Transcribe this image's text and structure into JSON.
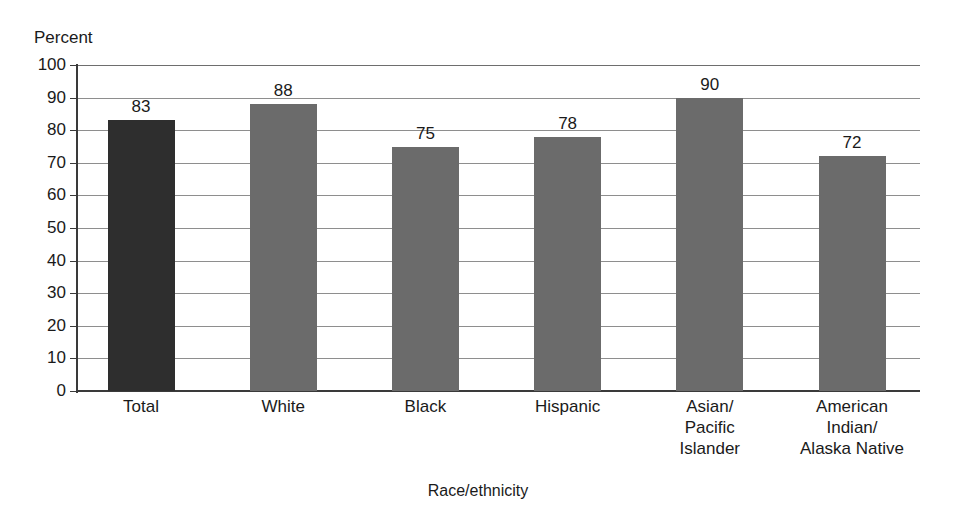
{
  "chart_data": {
    "type": "bar",
    "title": "",
    "subtitle": "",
    "xlabel": "Race/ethnicity",
    "ylabel": "Percent",
    "ylim": [
      0,
      100
    ],
    "yticks": [
      0,
      10,
      20,
      30,
      40,
      50,
      60,
      70,
      80,
      90,
      100
    ],
    "ytick_labels": [
      "0",
      "10",
      "20",
      "30",
      "40",
      "50",
      "60",
      "70",
      "80",
      "90",
      "100"
    ],
    "grid": true,
    "legend": "none",
    "data_labels": true,
    "categories": [
      "Total",
      "White",
      "Black",
      "Hispanic",
      "Asian/\nPacific\nIslander",
      "American\nIndian/\nAlaska Native"
    ],
    "values": [
      83,
      88,
      75,
      78,
      90,
      72
    ],
    "value_labels": [
      "83",
      "88",
      "75",
      "78",
      "90",
      "72"
    ],
    "bar_colors": [
      "#2e2e2e",
      "#6b6b6b",
      "#6b6b6b",
      "#6b6b6b",
      "#6b6b6b",
      "#6b6b6b"
    ],
    "colors": {
      "highlight_bar": "#2e2e2e",
      "standard_bar": "#6b6b6b",
      "gridline": "#8e8e8e",
      "axis": "#3a3a3a",
      "text": "#1a1a1a",
      "background": "#ffffff"
    }
  }
}
